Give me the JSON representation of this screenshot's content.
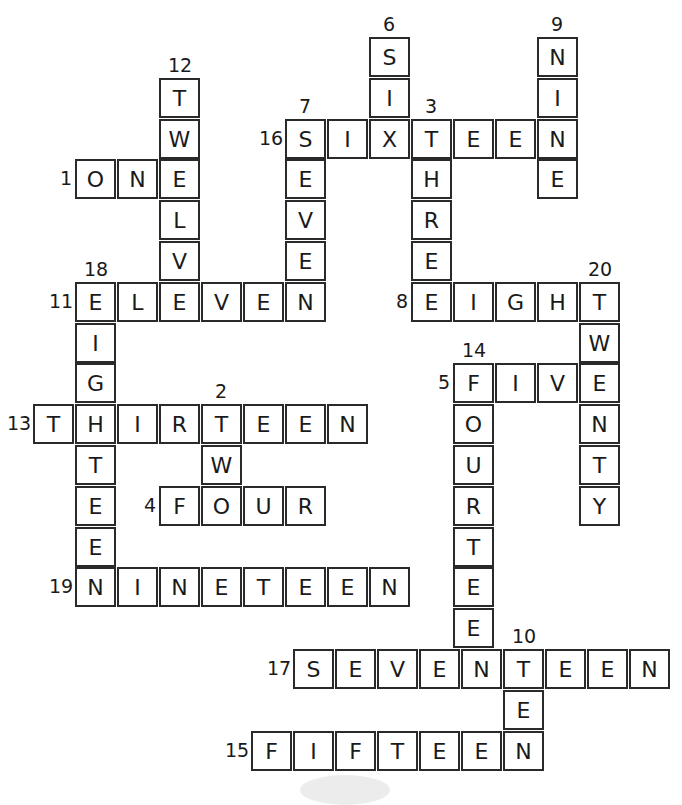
{
  "puzzle": {
    "type": "number-word crossword (filled)",
    "grid": {
      "origin_x": 33,
      "origin_y": 37,
      "cell_w": 42,
      "cell_h": 40.8
    },
    "words": [
      {
        "num": "1",
        "word": "ONE",
        "dir": "across",
        "col": 1,
        "row": 3,
        "label_side": "left"
      },
      {
        "num": "2",
        "word": "TWO",
        "dir": "down",
        "col": 4,
        "row": 9,
        "label_side": "top"
      },
      {
        "num": "3",
        "word": "THREE",
        "dir": "down",
        "col": 9,
        "row": 2,
        "label_side": "top"
      },
      {
        "num": "4",
        "word": "FOUR",
        "dir": "across",
        "col": 3,
        "row": 11,
        "label_side": "left"
      },
      {
        "num": "5",
        "word": "FIVE",
        "dir": "across",
        "col": 10,
        "row": 8,
        "label_side": "left"
      },
      {
        "num": "6",
        "word": "SIX",
        "dir": "down",
        "col": 8,
        "row": 0,
        "label_side": "top"
      },
      {
        "num": "7",
        "word": "SEVEN",
        "dir": "down",
        "col": 6,
        "row": 2,
        "label_side": "top"
      },
      {
        "num": "8",
        "word": "EIGHT",
        "dir": "across",
        "col": 9,
        "row": 6,
        "label_side": "left"
      },
      {
        "num": "9",
        "word": "NINE",
        "dir": "down",
        "col": 12,
        "row": 0,
        "label_side": "top"
      },
      {
        "num": "10",
        "word": "TEN",
        "dir": "down",
        "col": 11,
        "row": 15,
        "label_side": "top"
      },
      {
        "num": "11",
        "word": "ELEVEN",
        "dir": "across",
        "col": 1,
        "row": 6,
        "label_side": "left"
      },
      {
        "num": "12",
        "word": "TWELVE",
        "dir": "down",
        "col": 3,
        "row": 1,
        "label_side": "top"
      },
      {
        "num": "13",
        "word": "THIRTEEN",
        "dir": "across",
        "col": 0,
        "row": 9,
        "label_side": "left"
      },
      {
        "num": "14",
        "word": "FOURTEEN",
        "dir": "down",
        "col": 10,
        "row": 8,
        "label_side": "top"
      },
      {
        "num": "15",
        "word": "FIFTEEN",
        "dir": "across",
        "col": 5,
        "row": 17,
        "label_side": "left"
      },
      {
        "num": "16",
        "word": "SIXTEEN",
        "dir": "across",
        "col": 6,
        "row": 2,
        "label_side": "left"
      },
      {
        "num": "17",
        "word": "SEVENTEEN",
        "dir": "across",
        "col": 6,
        "row": 15,
        "label_side": "left"
      },
      {
        "num": "18",
        "word": "EIGHTEEN",
        "dir": "down",
        "col": 1,
        "row": 6,
        "label_side": "top"
      },
      {
        "num": "19",
        "word": "NINETEEN",
        "dir": "across",
        "col": 1,
        "row": 13,
        "label_side": "left"
      },
      {
        "num": "20",
        "word": "TWENTY",
        "dir": "down",
        "col": 13,
        "row": 6,
        "label_side": "top"
      }
    ]
  }
}
